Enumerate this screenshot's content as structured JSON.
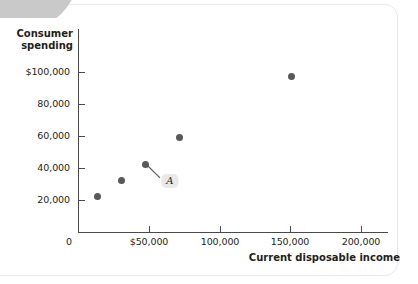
{
  "figure": {
    "background_color": "#ffffff",
    "accent_color": "#58595b",
    "axis_color": "#4a4a4a",
    "label_badge_color": "#e9e9ea"
  },
  "chart_data": {
    "type": "scatter",
    "title": "",
    "xlabel": "Current disposable income",
    "ylabel": "Consumer\nspending",
    "ylabel_line1": "Consumer",
    "ylabel_line2": "spending",
    "xlim": [
      0,
      215000
    ],
    "ylim": [
      0,
      110000
    ],
    "grid": false,
    "legend": null,
    "x_ticks": [
      {
        "value": 0,
        "label": "0"
      },
      {
        "value": 50000,
        "label": "$50,000"
      },
      {
        "value": 100000,
        "label": "100,000"
      },
      {
        "value": 150000,
        "label": "150,000"
      },
      {
        "value": 200000,
        "label": "200,000"
      }
    ],
    "y_ticks": [
      {
        "value": 100000,
        "label": "$100,000"
      },
      {
        "value": 80000,
        "label": "80,000"
      },
      {
        "value": 60000,
        "label": "60,000"
      },
      {
        "value": 40000,
        "label": "40,000"
      },
      {
        "value": 20000,
        "label": "20,000"
      }
    ],
    "points": [
      {
        "x": 14000,
        "y": 22000,
        "label": ""
      },
      {
        "x": 31000,
        "y": 32000,
        "label": ""
      },
      {
        "x": 48000,
        "y": 42500,
        "label": "A"
      },
      {
        "x": 72000,
        "y": 59000,
        "label": ""
      },
      {
        "x": 151000,
        "y": 97000,
        "label": ""
      }
    ],
    "annotations": [
      {
        "text": "A",
        "anchor_x": 48000,
        "anchor_y": 42500,
        "label_x": 65000,
        "label_y": 32000
      }
    ]
  }
}
